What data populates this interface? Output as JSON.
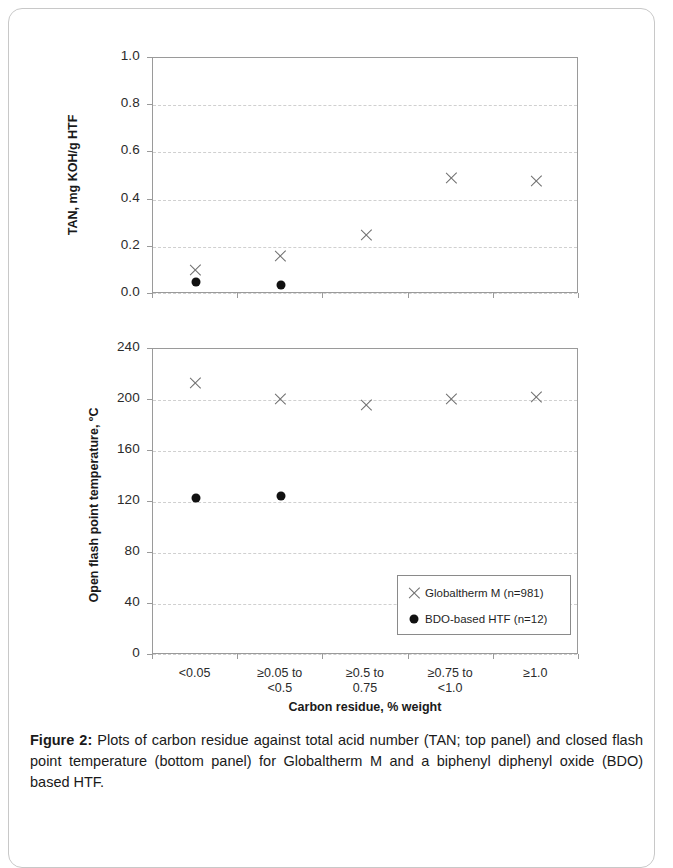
{
  "figure": {
    "caption_label": "Figure 2:",
    "caption_text": " Plots of carbon residue against total acid number (TAN; top panel) and closed flash point temperature (bottom panel) for Globaltherm M and a biphenyl diphenyl oxide (BDO) based HTF."
  },
  "legend": {
    "entries": [
      {
        "symbol": "x-marker-icon",
        "label": "Globaltherm M (n=981)"
      },
      {
        "symbol": "dot-marker-icon",
        "label": "BDO-based HTF (n=12)"
      }
    ]
  },
  "colors": {
    "x_marker": "#6e6e6e",
    "dot_marker": "#111111",
    "axis": "#9a9a9a",
    "gridline": "#d0d0d0",
    "text": "#1a1a1a"
  },
  "chart_data": [
    {
      "type": "scatter",
      "panel": "top",
      "title": "",
      "xlabel": "Carbon residue, % weight",
      "ylabel": "TAN, mg KOH/g HTF",
      "categories": [
        "<0.05",
        "≥0.05 to\n<0.5",
        "≥0.5 to\n0.75",
        "≥0.75 to\n<1.0",
        "≥1.0"
      ],
      "ytick_labels": [
        "1.0",
        "0.8",
        "0.6",
        "0.4",
        "0.2",
        "0.0"
      ],
      "yticks": [
        1.0,
        0.8,
        0.6,
        0.4,
        0.2,
        0.0
      ],
      "ylim": [
        0.0,
        1.0
      ],
      "grid": true,
      "legend_position": "none",
      "series": [
        {
          "name": "Globaltherm M (n=981)",
          "marker": "x",
          "values": [
            0.1,
            0.16,
            0.25,
            0.49,
            0.48
          ]
        },
        {
          "name": "BDO-based HTF (n=12)",
          "marker": "dot",
          "values": [
            0.05,
            0.04,
            null,
            null,
            null
          ]
        }
      ]
    },
    {
      "type": "scatter",
      "panel": "bottom",
      "title": "",
      "xlabel": "Carbon residue, % weight",
      "ylabel": "Open flash point temperature, ºC",
      "categories": [
        "<0.05",
        "≥0.05 to\n<0.5",
        "≥0.5 to\n0.75",
        "≥0.75 to\n<1.0",
        "≥1.0"
      ],
      "ytick_labels": [
        "240",
        "200",
        "160",
        "120",
        "80",
        "40",
        "0"
      ],
      "yticks": [
        240,
        200,
        160,
        120,
        80,
        40,
        0
      ],
      "ylim": [
        0,
        240
      ],
      "grid": true,
      "legend_position": "inside-bottom-right",
      "series": [
        {
          "name": "Globaltherm M (n=981)",
          "marker": "x",
          "values": [
            213,
            201,
            196,
            201,
            202
          ]
        },
        {
          "name": "BDO-based HTF (n=12)",
          "marker": "dot",
          "values": [
            123,
            125,
            null,
            null,
            null
          ]
        }
      ]
    }
  ]
}
